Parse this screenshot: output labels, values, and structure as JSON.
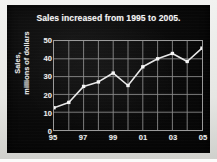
{
  "chart_data": {
    "type": "line",
    "title": "Sales increased from 1995 to 2005.",
    "xlabel": "",
    "ylabel": "Sales, millions of dollars",
    "ylabel_lines": [
      "Sales,",
      "millions of dollars"
    ],
    "x": [
      1995,
      1996,
      1997,
      1998,
      1999,
      2000,
      2001,
      2002,
      2003,
      2004,
      2005
    ],
    "values": [
      12.5,
      15.5,
      24.5,
      27,
      32,
      25,
      35.5,
      40,
      43,
      38.5,
      46
    ],
    "series": [
      {
        "name": "Sales",
        "values": [
          12.5,
          15.5,
          24.5,
          27,
          32,
          25,
          35.5,
          40,
          43,
          38.5,
          46
        ]
      }
    ],
    "xtick_labels": [
      "95",
      "",
      "97",
      "",
      "99",
      "",
      "01",
      "",
      "03",
      "",
      "05"
    ],
    "xtick_values": [
      1995,
      1996,
      1997,
      1998,
      1999,
      2000,
      2001,
      2002,
      2003,
      2004,
      2005
    ],
    "ytick_labels": [
      "0",
      "10",
      "20",
      "30",
      "40",
      "50"
    ],
    "ytick_values": [
      0,
      10,
      20,
      30,
      40,
      50
    ],
    "xlim": [
      1995,
      2005
    ],
    "ylim": [
      0,
      50
    ],
    "grid": true,
    "legend": "none",
    "markers": "square",
    "colors": {
      "background": "#0a0a0a",
      "line": "#e8e8e8",
      "marker": "#f5f5f5",
      "grid": "#8a8a8a",
      "axis": "#9a9a9a",
      "text": "#f0f0f0",
      "paper": "#ededea"
    }
  }
}
